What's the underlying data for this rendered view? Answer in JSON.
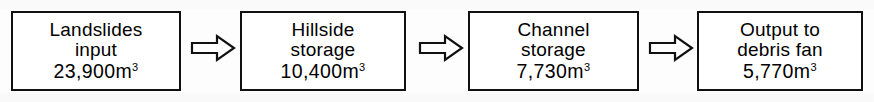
{
  "diagram": {
    "type": "flowchart",
    "orientation": "left-to-right",
    "title": "",
    "unit": "m3",
    "background_color": "#ffffff",
    "stroke_color": "#111111",
    "text_color": "#000000",
    "nodes": [
      {
        "id": "landslides-input",
        "label_line1": "Landslides",
        "label_line2": "input",
        "value": "23,900",
        "unit": "m",
        "exponent": "3",
        "value_text": "23,900m"
      },
      {
        "id": "hillside-storage",
        "label_line1": "Hillside",
        "label_line2": "storage",
        "value": "10,400",
        "unit": "m",
        "exponent": "3",
        "value_text": "10,400m"
      },
      {
        "id": "channel-storage",
        "label_line1": "Channel",
        "label_line2": "storage",
        "value": "7,730",
        "unit": "m",
        "exponent": "3",
        "value_text": "7,730m"
      },
      {
        "id": "output-to-debris-fan",
        "label_line1": "Output to",
        "label_line2": "debris fan",
        "value": "5,770",
        "unit": "m",
        "exponent": "3",
        "value_text": "5,770m"
      }
    ],
    "connectors": [
      {
        "id": "arrow-1",
        "from": "landslides-input",
        "to": "hillside-storage",
        "glyph": "block-arrow-right"
      },
      {
        "id": "arrow-2",
        "from": "hillside-storage",
        "to": "channel-storage",
        "glyph": "block-arrow-right"
      },
      {
        "id": "arrow-3",
        "from": "channel-storage",
        "to": "output-to-debris-fan",
        "glyph": "block-arrow-right"
      }
    ]
  }
}
